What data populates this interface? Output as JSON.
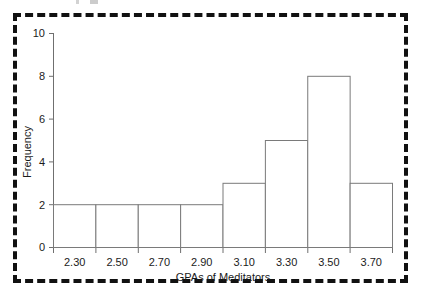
{
  "chart_data": {
    "type": "bar",
    "title": "",
    "subtitle": "",
    "xlabel": "GPAs of Meditators",
    "ylabel": "Frequency",
    "categories": [
      "2.30",
      "2.50",
      "2.70",
      "2.90",
      "3.10",
      "3.30",
      "3.50",
      "3.70"
    ],
    "values": [
      2,
      2,
      2,
      2,
      3,
      5,
      8,
      3
    ],
    "bin_edges": [
      2.2,
      2.4,
      2.6,
      2.8,
      3.0,
      3.2,
      3.4,
      3.6,
      3.8
    ],
    "bin_width": 0.2,
    "xlim": [
      2.2,
      3.8
    ],
    "ylim": [
      0,
      10
    ],
    "ytick_labels": [
      "0",
      "2",
      "4",
      "6",
      "8",
      "10"
    ],
    "ytick_values": [
      0,
      2,
      4,
      6,
      8,
      10
    ],
    "xtick_labels": [
      "2.30",
      "2.50",
      "2.70",
      "2.90",
      "3.10",
      "3.30",
      "3.50",
      "3.70"
    ],
    "grid": false,
    "legend": null,
    "total_count": 27,
    "style": {
      "bar_fill": "#ffffff",
      "bar_stroke": "#7a7a7a",
      "axis_color": "#6f6f6f",
      "text_color": "#1b1b1b",
      "background": "#ffffff",
      "border_color": "#111111"
    }
  },
  "axes": {
    "y": {
      "title": "Frequency",
      "ticks": [
        {
          "label": "10",
          "value": 10
        },
        {
          "label": "8",
          "value": 8
        },
        {
          "label": "6",
          "value": 6
        },
        {
          "label": "4",
          "value": 4
        },
        {
          "label": "2",
          "value": 2
        },
        {
          "label": "0",
          "value": 0
        }
      ]
    },
    "x": {
      "title": "GPAs of Meditators",
      "ticks": [
        {
          "label": "2.30",
          "value": 2.3
        },
        {
          "label": "2.50",
          "value": 2.5
        },
        {
          "label": "2.70",
          "value": 2.7
        },
        {
          "label": "2.90",
          "value": 2.9
        },
        {
          "label": "3.10",
          "value": 3.1
        },
        {
          "label": "3.30",
          "value": 3.3
        },
        {
          "label": "3.50",
          "value": 3.5
        },
        {
          "label": "3.70",
          "value": 3.7
        }
      ]
    }
  }
}
